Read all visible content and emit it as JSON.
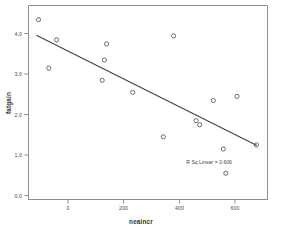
{
  "chart_data": {
    "type": "scatter",
    "title": "",
    "xlabel": "neaincr",
    "ylabel": "fatgain",
    "xlim": [
      -130,
      730
    ],
    "ylim": [
      -0.25,
      4.55
    ],
    "xticks": [
      0,
      200,
      400,
      600
    ],
    "xtick_labels": [
      "0",
      "200",
      "400",
      "600"
    ],
    "yticks": [
      0.0,
      1.0,
      2.0,
      3.0,
      4.0
    ],
    "ytick_labels": [
      "0.0",
      "1.0",
      "2.0",
      "3.0",
      "4.0"
    ],
    "grid": false,
    "legend": "none",
    "marker": "open-circle",
    "x": [
      -94,
      -57,
      -29,
      135,
      143,
      151,
      245,
      355,
      392,
      473,
      486,
      535,
      571,
      580,
      620,
      690
    ],
    "y": [
      4.2,
      3.0,
      3.7,
      2.7,
      3.2,
      3.6,
      2.4,
      1.3,
      3.8,
      1.7,
      1.6,
      2.2,
      1.0,
      0.4,
      2.3,
      1.1
    ],
    "fit_line": {
      "type": "linear",
      "x_start": -100,
      "y_start": 3.81,
      "x_end": 690,
      "y_end": 1.09
    },
    "annotation": {
      "text": "R Sq Linear = 0.606",
      "x": 520,
      "y": 0.62
    }
  }
}
